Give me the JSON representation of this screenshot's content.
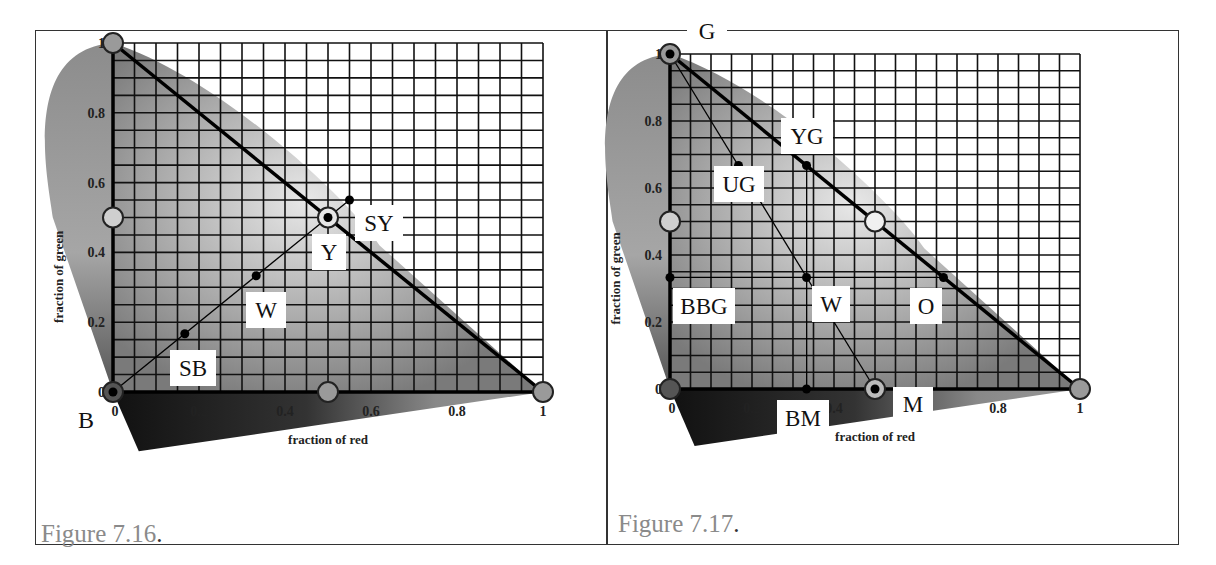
{
  "figures": [
    {
      "id": "fig-7-16",
      "caption": "Figure 7.16",
      "caption_dot": ".",
      "xlabel": "fraction of red",
      "ylabel": "fraction of green",
      "x_ticks": [
        "0",
        "0.2",
        "0.4",
        "0.6",
        "0.8",
        "1"
      ],
      "y_ticks": [
        "0",
        "0.2",
        "0.4",
        "0.6",
        "0.8",
        "1"
      ],
      "points": [
        {
          "label": "B",
          "x": 0,
          "y": 0
        },
        {
          "label": "SB",
          "x": 0.167,
          "y": 0.167
        },
        {
          "label": "W",
          "x": 0.333,
          "y": 0.333
        },
        {
          "label": "Y",
          "x": 0.5,
          "y": 0.5
        },
        {
          "label": "SY",
          "x": 0.55,
          "y": 0.55
        }
      ]
    },
    {
      "id": "fig-7-17",
      "caption": "Figure 7.17",
      "caption_dot": ".",
      "xlabel": "fraction of red",
      "ylabel": "fraction of green",
      "x_ticks": [
        "0",
        "0.2",
        "0.4",
        "0.6",
        "0.8",
        "1"
      ],
      "y_ticks": [
        "0",
        "0.2",
        "0.4",
        "0.6",
        "0.8",
        "1"
      ],
      "points": [
        {
          "label": "G",
          "x": 0,
          "y": 1
        },
        {
          "label": "YG",
          "x": 0.333,
          "y": 0.667
        },
        {
          "label": "UG",
          "x": 0.167,
          "y": 0.667
        },
        {
          "label": "W",
          "x": 0.333,
          "y": 0.333
        },
        {
          "label": "BBG",
          "x": 0,
          "y": 0.333
        },
        {
          "label": "O",
          "x": 0.667,
          "y": 0.333
        },
        {
          "label": "BM",
          "x": 0.333,
          "y": 0
        },
        {
          "label": "M",
          "x": 0.5,
          "y": 0
        }
      ]
    }
  ],
  "chart_data": [
    {
      "type": "scatter",
      "title": "Figure 7.16",
      "xlabel": "fraction of red",
      "ylabel": "fraction of green",
      "xlim": [
        0,
        1
      ],
      "ylim": [
        0,
        1
      ],
      "grid": true,
      "grid_step": 0.05,
      "series": [
        {
          "name": "blue-yellow line",
          "x": [
            0,
            0.167,
            0.333,
            0.5,
            0.55
          ],
          "y": [
            0,
            0.167,
            0.333,
            0.5,
            0.55
          ],
          "labels": [
            "B",
            "SB",
            "W",
            "Y",
            "SY"
          ]
        },
        {
          "name": "primaries (circles)",
          "x": [
            0,
            0,
            0.5,
            1,
            0.5
          ],
          "y": [
            1,
            0.5,
            0,
            0,
            0.5
          ]
        }
      ]
    },
    {
      "type": "scatter",
      "title": "Figure 7.17",
      "xlabel": "fraction of red",
      "ylabel": "fraction of green",
      "xlim": [
        0,
        1
      ],
      "ylim": [
        0,
        1
      ],
      "grid": true,
      "grid_step": 0.05,
      "series": [
        {
          "name": "green-magenta line",
          "x": [
            0,
            0.167,
            0.333,
            0.5
          ],
          "y": [
            1,
            0.667,
            0.333,
            0
          ],
          "labels": [
            "G",
            "UG",
            "W",
            "M"
          ]
        },
        {
          "name": "vertical through W",
          "x": [
            0.333,
            0.333,
            0.333
          ],
          "y": [
            0.667,
            0.333,
            0
          ],
          "labels": [
            "YG",
            "W",
            "BM"
          ]
        },
        {
          "name": "horizontal through W",
          "x": [
            0,
            0.333,
            0.667
          ],
          "y": [
            0.333,
            0.333,
            0.333
          ],
          "labels": [
            "BBG",
            "W",
            "O"
          ]
        },
        {
          "name": "primaries (circles)",
          "x": [
            0,
            0,
            0,
            1,
            0.5,
            0.5
          ],
          "y": [
            1,
            0.5,
            0,
            0,
            0,
            0.5
          ]
        }
      ]
    }
  ]
}
